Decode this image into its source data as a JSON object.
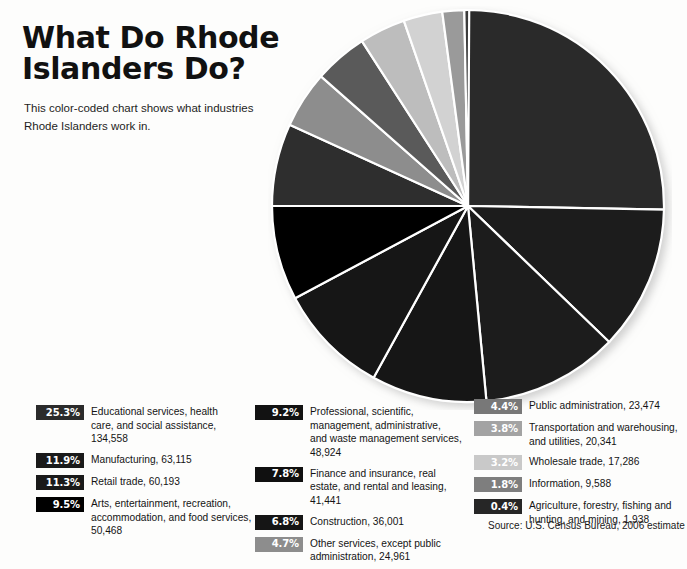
{
  "headline": {
    "title": "What Do Rhode\nIslanders Do?",
    "subtitle": "This color-coded chart shows what industries\nRhode Islanders work in."
  },
  "source": {
    "text": "Source: U.S. Census Bureau, 2006 estimate"
  },
  "legend": {
    "columns": [
      {
        "name": "legend-column-1",
        "items": [
          {
            "pct": "25.3%",
            "label": "Educational services, health\ncare, and social assistance,\n134,558",
            "color": "#2b2b2b",
            "text_color": "#ffffff"
          },
          {
            "pct": "11.9%",
            "label": "Manufacturing, 63,115",
            "color": "#1a1a1a",
            "text_color": "#ffffff"
          },
          {
            "pct": "11.3%",
            "label": "Retail trade, 60,193",
            "color": "#1a1a1a",
            "text_color": "#ffffff"
          },
          {
            "pct": "9.5%",
            "label": "Arts, entertainment, recreation,\naccommodation, and food services,\n50,468",
            "color": "#000000",
            "text_color": "#ffffff"
          }
        ]
      },
      {
        "name": "legend-column-2",
        "items": [
          {
            "pct": "9.2%",
            "label": "Professional, scientific,\nmanagement, administrative,\nand waste management services,\n48,924",
            "color": "#121212",
            "text_color": "#ffffff"
          },
          {
            "pct": "7.8%",
            "label": "Finance and insurance, real\nestate, and rental and leasing,\n41,441",
            "color": "#101010",
            "text_color": "#ffffff"
          },
          {
            "pct": "6.8%",
            "label": "Construction, 36,001",
            "color": "#151515",
            "text_color": "#ffffff"
          },
          {
            "pct": "4.7%",
            "label": "Other services, except public\nadministration, 24,961",
            "color": "#8d8d8d",
            "text_color": "#ffffff"
          }
        ]
      },
      {
        "name": "legend-column-3",
        "items": [
          {
            "pct": "4.4%",
            "label": "Public administration, 23,474",
            "color": "#787878",
            "text_color": "#ffffff"
          },
          {
            "pct": "3.8%",
            "label": "Transportation and warehousing,\nand utilities, 20,341",
            "color": "#a3a3a3",
            "text_color": "#ffffff"
          },
          {
            "pct": "3.2%",
            "label": "Wholesale trade, 17,286",
            "color": "#c9c9c9",
            "text_color": "#ffffff"
          },
          {
            "pct": "1.8%",
            "label": "Information, 9,588",
            "color": "#7e7e7e",
            "text_color": "#ffffff"
          },
          {
            "pct": "0.4%",
            "label": "Agriculture, forestry, fishing and\nhunting, and mining, 1,938",
            "color": "#262626",
            "text_color": "#ffffff"
          }
        ]
      }
    ]
  },
  "chart_data": {
    "type": "pie",
    "title": "What Do Rhode Islanders Do?",
    "subtitle": "This color-coded chart shows what industries Rhode Islanders work in.",
    "unit": "workers",
    "total": 536220,
    "start_angle_deg": 0,
    "direction": "clockwise",
    "legend_position": "bottom",
    "source": "Source: U.S. Census Bureau, 2006 estimate",
    "slices": [
      {
        "label": "Educational services, health care, and social assistance",
        "percent": 25.3,
        "value": 134558,
        "color": "#2b2b2b"
      },
      {
        "label": "Manufacturing",
        "percent": 11.9,
        "value": 63115,
        "color": "#1a1a1a"
      },
      {
        "label": "Retail trade",
        "percent": 11.3,
        "value": 60193,
        "color": "#1f1f1f"
      },
      {
        "label": "Arts, entertainment, recreation, accommodation, and food services",
        "percent": 9.5,
        "value": 50468,
        "color": "#181818"
      },
      {
        "label": "Professional, scientific, management, administrative, and waste management services",
        "percent": 9.2,
        "value": 48924,
        "color": "#121212"
      },
      {
        "label": "Finance and insurance, real estate, and rental and leasing",
        "percent": 7.8,
        "value": 41441,
        "color": "#000000"
      },
      {
        "label": "Construction",
        "percent": 6.8,
        "value": 36001,
        "color": "#2e2e2e"
      },
      {
        "label": "Other services, except public administration",
        "percent": 4.7,
        "value": 24961,
        "color": "#8d8d8d"
      },
      {
        "label": "Public administration",
        "percent": 4.4,
        "value": 23474,
        "color": "#5a5a5a"
      },
      {
        "label": "Transportation and warehousing, and utilities",
        "percent": 3.8,
        "value": 20341,
        "color": "#bdbdbd"
      },
      {
        "label": "Wholesale trade",
        "percent": 3.2,
        "value": 17286,
        "color": "#d2d2d2"
      },
      {
        "label": "Information",
        "percent": 1.8,
        "value": 9588,
        "color": "#9a9a9a"
      },
      {
        "label": "Agriculture, forestry, fishing and hunting, and mining",
        "percent": 0.4,
        "value": 1938,
        "color": "#3a3a3a"
      }
    ],
    "geometry": {
      "cx": 200,
      "cy": 200,
      "r": 196,
      "stroke": "#ffffff",
      "stroke_width": 2.2
    }
  }
}
